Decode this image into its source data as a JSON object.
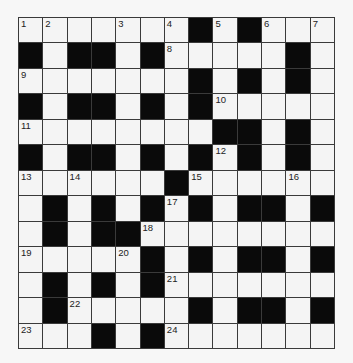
{
  "puzzle": {
    "rows": 13,
    "cols": 13,
    "colors": {
      "block": "#0a0a0a",
      "cell": "#f4f4f4",
      "line": "#3a3a3a"
    },
    "layout": [
      "WWWWWWWBWBWWW",
      "BWBBWBWWWWWBW",
      "WWWWWWWBWBWBW",
      "BWBBWBWBWWWWW",
      "WWWWWWWWBBWBW",
      "BWBBWBWBWBWBW",
      "WWWWWWBWWWWWW",
      "WBWBWBWBWBBWB",
      "WBWBBWWWWWWWW",
      "WWWWWBWBWBBWB",
      "WBWBWBWWWWWWW",
      "WBWWWWWBWBBWB",
      "WWWBWBWWWWWWW"
    ],
    "numbers": [
      {
        "r": 0,
        "c": 0,
        "n": "1"
      },
      {
        "r": 0,
        "c": 1,
        "n": "2"
      },
      {
        "r": 0,
        "c": 4,
        "n": "3"
      },
      {
        "r": 0,
        "c": 6,
        "n": "4"
      },
      {
        "r": 0,
        "c": 8,
        "n": "5"
      },
      {
        "r": 0,
        "c": 10,
        "n": "6"
      },
      {
        "r": 0,
        "c": 12,
        "n": "7"
      },
      {
        "r": 1,
        "c": 6,
        "n": "8"
      },
      {
        "r": 2,
        "c": 0,
        "n": "9"
      },
      {
        "r": 3,
        "c": 8,
        "n": "10"
      },
      {
        "r": 4,
        "c": 0,
        "n": "11"
      },
      {
        "r": 5,
        "c": 8,
        "n": "12"
      },
      {
        "r": 6,
        "c": 0,
        "n": "13"
      },
      {
        "r": 6,
        "c": 2,
        "n": "14"
      },
      {
        "r": 6,
        "c": 7,
        "n": "15"
      },
      {
        "r": 6,
        "c": 11,
        "n": "16"
      },
      {
        "r": 7,
        "c": 6,
        "n": "17"
      },
      {
        "r": 8,
        "c": 5,
        "n": "18"
      },
      {
        "r": 9,
        "c": 0,
        "n": "19"
      },
      {
        "r": 9,
        "c": 4,
        "n": "20"
      },
      {
        "r": 10,
        "c": 6,
        "n": "21"
      },
      {
        "r": 11,
        "c": 2,
        "n": "22"
      },
      {
        "r": 12,
        "c": 0,
        "n": "23"
      },
      {
        "r": 12,
        "c": 6,
        "n": "24"
      }
    ],
    "entries": {}
  }
}
